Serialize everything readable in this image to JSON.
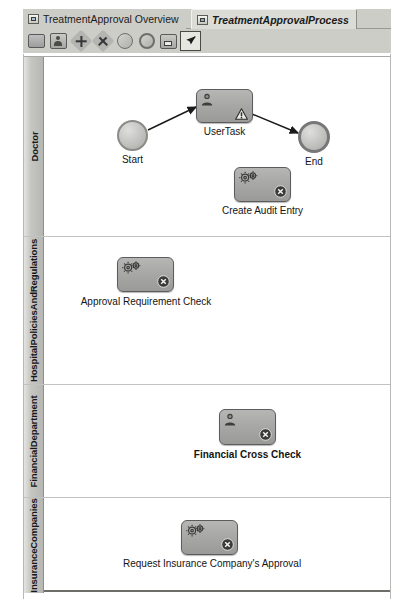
{
  "window": {
    "tabs": [
      {
        "label": "TreatmentApproval Overview",
        "icon": "diagram-overview-icon",
        "active": false
      },
      {
        "label": "TreatmentApprovalProcess",
        "icon": "process-diagram-icon",
        "active": true
      }
    ]
  },
  "toolbar": {
    "items": [
      {
        "name": "task-tool",
        "icon": "task-rectangle-icon",
        "selected": false
      },
      {
        "name": "user-task-tool",
        "icon": "user-task-icon",
        "selected": false
      },
      {
        "name": "cancel-event-tool",
        "icon": "cancel-x-icon",
        "selected": false
      },
      {
        "name": "gateway-tool",
        "icon": "plus-gateway-icon",
        "selected": false
      },
      {
        "name": "start-event-tool",
        "icon": "start-event-circle-icon",
        "selected": false
      },
      {
        "name": "end-event-tool",
        "icon": "end-event-circle-icon",
        "selected": false
      },
      {
        "name": "sub-process-tool",
        "icon": "sub-process-icon",
        "selected": false
      },
      {
        "name": "select-tool",
        "icon": "arrow-pointer-icon",
        "selected": true
      }
    ]
  },
  "diagram": {
    "lanes": [
      {
        "title": "Doctor",
        "nodes": [
          {
            "id": "start",
            "type": "start-event",
            "label": "Start"
          },
          {
            "id": "usertask",
            "type": "user-task",
            "label": "UserTask",
            "markers": [
              "user-icon",
              "warning-triangle-icon"
            ]
          },
          {
            "id": "end",
            "type": "end-event",
            "label": "End"
          },
          {
            "id": "audit",
            "type": "service-task",
            "label": "Create Audit Entry",
            "markers": [
              "gears-icon",
              "cancel-badge-icon"
            ]
          }
        ],
        "flows": [
          {
            "from": "start",
            "to": "usertask"
          },
          {
            "from": "usertask",
            "to": "end"
          }
        ]
      },
      {
        "title": "HospitalPoliciesAndRegulations",
        "nodes": [
          {
            "id": "approvalcheck",
            "type": "service-task",
            "label": "Approval Requirement Check",
            "markers": [
              "gears-icon",
              "cancel-badge-icon"
            ]
          }
        ],
        "flows": []
      },
      {
        "title": "FinancialDepartment",
        "nodes": [
          {
            "id": "financial",
            "type": "user-task",
            "label": "Financial Cross Check",
            "selected": true,
            "markers": [
              "user-icon",
              "cancel-badge-icon"
            ]
          }
        ],
        "flows": []
      },
      {
        "title": "InsuranceCompanies",
        "nodes": [
          {
            "id": "insurance",
            "type": "service-task",
            "label": "Request Insurance Company's Approval",
            "markers": [
              "gears-icon",
              "cancel-badge-icon"
            ]
          }
        ],
        "flows": []
      }
    ]
  },
  "colors": {
    "chrome": "#cdcdc8",
    "lane_header": "#c6c6c2",
    "task_fill": "#a8a8a6",
    "task_border": "#5c5c5e",
    "canvas": "#ffffff"
  }
}
